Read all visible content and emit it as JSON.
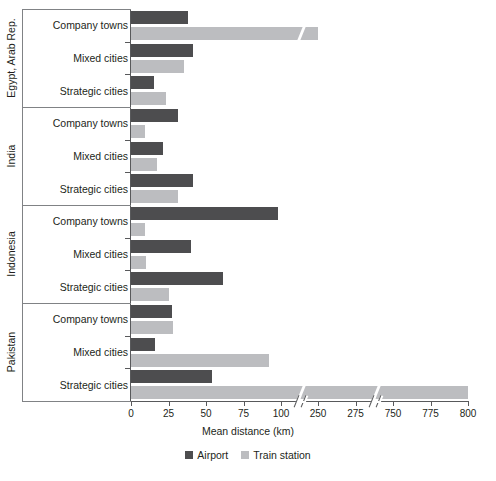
{
  "chart_data": {
    "type": "bar",
    "orientation": "horizontal",
    "title": "",
    "xlabel": "Mean distance (km)",
    "ylabel": "",
    "grid": false,
    "legend_position": "bottom",
    "legend": [
      "Airport",
      "Train station"
    ],
    "axis_breaks": [
      [
        110,
        240
      ],
      [
        285,
        740
      ]
    ],
    "xticks": [
      0,
      25,
      50,
      75,
      100,
      250,
      275,
      750,
      775,
      800
    ],
    "xtick_labels": [
      "0",
      "25",
      "50",
      "75",
      "100",
      "250",
      "275",
      "750",
      "775",
      "800"
    ],
    "xlim": [
      0,
      800
    ],
    "colors": {
      "airport": "#4d4d4f",
      "train": "#bcbdc0"
    },
    "groups": [
      {
        "name": "Egypt, Arab Rep.",
        "categories": [
          "Company towns",
          "Mixed cities",
          "Strategic cities"
        ],
        "series": [
          {
            "name": "Airport",
            "values": [
              38,
              41,
              15
            ]
          },
          {
            "name": "Train station",
            "values": [
              250,
              35,
              23
            ]
          }
        ]
      },
      {
        "name": "India",
        "categories": [
          "Company towns",
          "Mixed cities",
          "Strategic cities"
        ],
        "series": [
          {
            "name": "Airport",
            "values": [
              31,
              21,
              41
            ]
          },
          {
            "name": "Train station",
            "values": [
              9,
              17,
              31
            ]
          }
        ]
      },
      {
        "name": "Indonesia",
        "categories": [
          "Company towns",
          "Mixed cities",
          "Strategic cities"
        ],
        "series": [
          {
            "name": "Airport",
            "values": [
              98,
              40,
              61
            ]
          },
          {
            "name": "Train station",
            "values": [
              9,
              10,
              25
            ]
          }
        ]
      },
      {
        "name": "Pakistan",
        "categories": [
          "Company towns",
          "Mixed cities",
          "Strategic cities"
        ],
        "series": [
          {
            "name": "Airport",
            "values": [
              27,
              16,
              54
            ]
          },
          {
            "name": "Train station",
            "values": [
              28,
              92,
              800
            ]
          }
        ]
      }
    ]
  },
  "axis": {
    "title": "Mean distance (km)"
  },
  "legend": {
    "items": [
      {
        "label": "Airport",
        "color": "#4d4d4f",
        "swatch": "square-dark-swatch"
      },
      {
        "label": "Train station",
        "color": "#bcbdc0",
        "swatch": "square-light-swatch"
      }
    ]
  }
}
